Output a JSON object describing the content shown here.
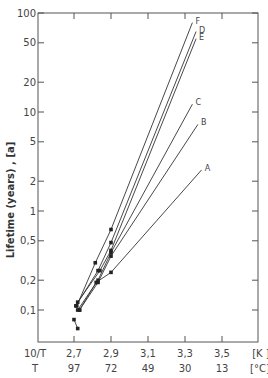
{
  "chart_data": {
    "type": "line",
    "title": "",
    "xlabel_row1": "10/T",
    "xlabel_row2": "T",
    "x_unit_row1": "[K ]",
    "x_unit_row2": "[°C]",
    "ylabel": "Lifetime (years) , [a]",
    "yscale": "log",
    "ylim": [
      0.05,
      100
    ],
    "xlim": [
      2.6,
      3.7
    ],
    "x_ticks": [
      {
        "value": 2.7,
        "label": "2,7",
        "celsius": "97"
      },
      {
        "value": 2.9,
        "label": "2,9",
        "celsius": "72"
      },
      {
        "value": 3.1,
        "label": "3,1",
        "celsius": "49"
      },
      {
        "value": 3.3,
        "label": "3,3",
        "celsius": "30"
      },
      {
        "value": 3.5,
        "label": "3,5",
        "celsius": "13"
      }
    ],
    "y_ticks": [
      {
        "value": 100,
        "label": "100"
      },
      {
        "value": 50,
        "label": "50"
      },
      {
        "value": 20,
        "label": "20"
      },
      {
        "value": 10,
        "label": "10"
      },
      {
        "value": 5,
        "label": "5"
      },
      {
        "value": 2,
        "label": "2"
      },
      {
        "value": 1,
        "label": "1"
      },
      {
        "value": 0.5,
        "label": "0,5"
      },
      {
        "value": 0.2,
        "label": "0,2"
      },
      {
        "value": 0.1,
        "label": "0,1"
      }
    ],
    "series": [
      {
        "name": "F",
        "x": [
          2.715,
          2.815,
          2.9,
          3.34
        ],
        "y": [
          0.11,
          0.3,
          0.65,
          80
        ]
      },
      {
        "name": "D",
        "x": [
          2.71,
          2.83,
          2.9,
          3.36
        ],
        "y": [
          0.11,
          0.25,
          0.48,
          65
        ]
      },
      {
        "name": "E",
        "x": [
          2.72,
          2.84,
          2.9,
          3.36
        ],
        "y": [
          0.12,
          0.25,
          0.4,
          55
        ]
      },
      {
        "name": "C",
        "x": [
          2.72,
          2.83,
          2.9,
          3.34
        ],
        "y": [
          0.1,
          0.2,
          0.38,
          12
        ]
      },
      {
        "name": "B",
        "x": [
          2.73,
          2.83,
          2.9,
          3.37
        ],
        "y": [
          0.1,
          0.19,
          0.35,
          7.5
        ]
      },
      {
        "name": "A",
        "x": [
          2.73,
          2.82,
          2.9,
          3.39
        ],
        "y": [
          0.1,
          0.19,
          0.24,
          2.6
        ]
      },
      {
        "name": "low",
        "x": [
          2.7,
          2.72
        ],
        "y": [
          0.08,
          0.065
        ]
      }
    ],
    "grid": false,
    "legend": "inline labels at line ends"
  }
}
